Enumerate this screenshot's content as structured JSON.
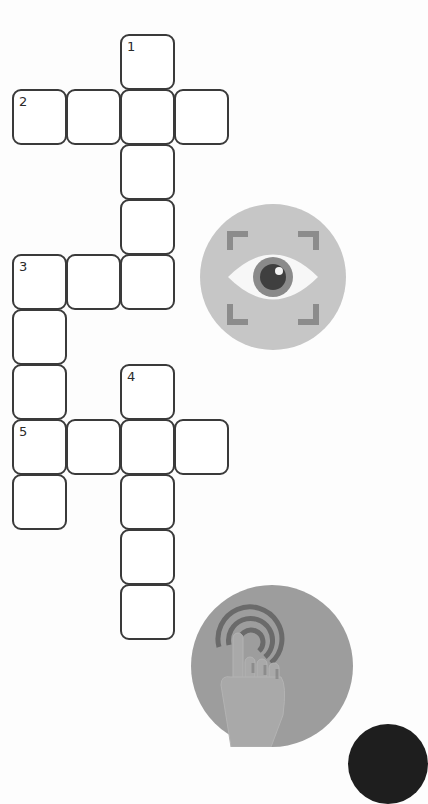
{
  "puzzle": {
    "type": "crossword",
    "grid_geometry": {
      "col_x": [
        12,
        66,
        120,
        174
      ],
      "row_y": [
        34,
        89,
        144,
        199,
        254,
        309,
        364,
        419,
        474,
        529,
        584
      ]
    },
    "clue_numbers": {
      "n1": "1",
      "n2": "2",
      "n3": "3",
      "n4": "4",
      "n5": "5"
    },
    "cells": [
      {
        "col": 2,
        "row": 0,
        "number": "1",
        "value": ""
      },
      {
        "col": 0,
        "row": 1,
        "number": "2",
        "value": ""
      },
      {
        "col": 1,
        "row": 1,
        "number": "",
        "value": ""
      },
      {
        "col": 2,
        "row": 1,
        "number": "",
        "value": ""
      },
      {
        "col": 3,
        "row": 1,
        "number": "",
        "value": ""
      },
      {
        "col": 2,
        "row": 2,
        "number": "",
        "value": ""
      },
      {
        "col": 2,
        "row": 3,
        "number": "",
        "value": ""
      },
      {
        "col": 0,
        "row": 4,
        "number": "3",
        "value": ""
      },
      {
        "col": 1,
        "row": 4,
        "number": "",
        "value": ""
      },
      {
        "col": 2,
        "row": 4,
        "number": "",
        "value": ""
      },
      {
        "col": 0,
        "row": 5,
        "number": "",
        "value": ""
      },
      {
        "col": 0,
        "row": 6,
        "number": "",
        "value": ""
      },
      {
        "col": 2,
        "row": 6,
        "number": "4",
        "value": ""
      },
      {
        "col": 0,
        "row": 7,
        "number": "5",
        "value": ""
      },
      {
        "col": 1,
        "row": 7,
        "number": "",
        "value": ""
      },
      {
        "col": 2,
        "row": 7,
        "number": "",
        "value": ""
      },
      {
        "col": 3,
        "row": 7,
        "number": "",
        "value": ""
      },
      {
        "col": 0,
        "row": 8,
        "number": "",
        "value": ""
      },
      {
        "col": 2,
        "row": 8,
        "number": "",
        "value": ""
      },
      {
        "col": 2,
        "row": 9,
        "number": "",
        "value": ""
      },
      {
        "col": 2,
        "row": 10,
        "number": "",
        "value": ""
      }
    ]
  },
  "icons": {
    "eye": "eye-scan-icon",
    "touch": "touch-tap-icon"
  },
  "colors": {
    "cell_border": "#3a3a3a",
    "eye_badge_bg": "#c6c6c6",
    "touch_badge_bg": "#9d9d9d",
    "dark_corner": "#1e1e1e"
  }
}
